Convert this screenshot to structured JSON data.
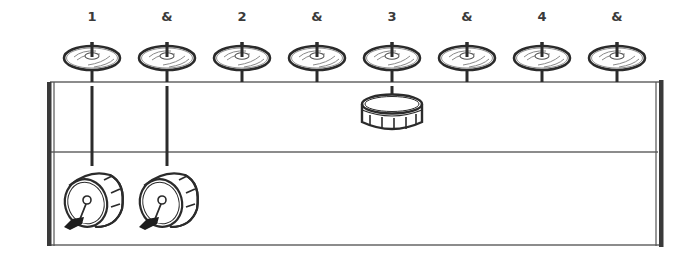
{
  "diagram": {
    "type": "drum-groove-notation",
    "counts": [
      "1",
      "&",
      "2",
      "&",
      "3",
      "&",
      "4",
      "&"
    ],
    "count_x": [
      92,
      167,
      242,
      317,
      392,
      467,
      542,
      617
    ],
    "rows": {
      "hihat": {
        "label": "hi-hat",
        "hits": [
          1,
          1,
          1,
          1,
          1,
          1,
          1,
          1
        ]
      },
      "snare": {
        "label": "snare",
        "hits": [
          0,
          0,
          0,
          0,
          1,
          0,
          0,
          0
        ]
      },
      "kick": {
        "label": "bass drum",
        "hits": [
          1,
          1,
          0,
          0,
          0,
          0,
          0,
          0
        ]
      }
    },
    "colors": {
      "ink": "#2b2b2b",
      "line": "#555555",
      "background": "#ffffff"
    }
  }
}
